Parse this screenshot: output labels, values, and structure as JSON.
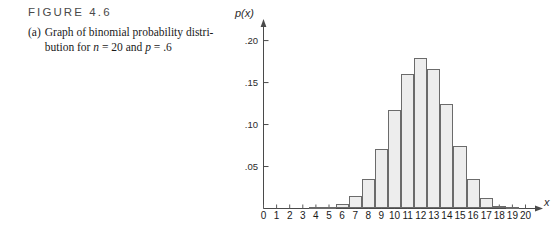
{
  "caption": {
    "figure_label": "FIGURE 4.6",
    "item_marker": "(a)",
    "text_part1": "Graph of binomial probability distri-bution for ",
    "line1": "Graph of binomial probability distri-",
    "line2_pre": "bution for ",
    "var_n": "n",
    "eq1": " = 20 and ",
    "var_p": "p",
    "eq2": " = .6",
    "full_text": "(a) Graph of binomial probability distribution for n = 20 and p = .6"
  },
  "chart_data": {
    "type": "bar",
    "title": "",
    "subtitle": "",
    "xlabel": "x",
    "ylabel": "p(x)",
    "xlim": [
      0,
      20
    ],
    "ylim": [
      0,
      0.215
    ],
    "grid": false,
    "legend": null,
    "bar_fill_color": "#ededed",
    "bar_stroke_color": "#6b6b6b",
    "axis_color": "#4a4a4a",
    "xtick_labels": [
      "0",
      "1",
      "2",
      "3",
      "4",
      "5",
      "6",
      "7",
      "8",
      "9",
      "10",
      "11",
      "12",
      "13",
      "14",
      "15",
      "16",
      "17",
      "18",
      "19",
      "20"
    ],
    "ytick_labels": [
      ".05",
      ".10",
      ".15",
      ".20"
    ],
    "ytick_values": [
      0.05,
      0.1,
      0.15,
      0.2
    ],
    "categories": [
      0,
      1,
      2,
      3,
      4,
      5,
      6,
      7,
      8,
      9,
      10,
      11,
      12,
      13,
      14,
      15,
      16,
      17,
      18,
      19,
      20
    ],
    "values": [
      0.0,
      0.0,
      0.0,
      0.0,
      0.0003,
      0.0013,
      0.0049,
      0.0146,
      0.0355,
      0.071,
      0.1171,
      0.1597,
      0.1797,
      0.1659,
      0.1244,
      0.0746,
      0.035,
      0.0123,
      0.0031,
      0.0005,
      0.0
    ],
    "distribution": "binomial",
    "parameters": {
      "n": 20,
      "p": 0.6
    }
  }
}
